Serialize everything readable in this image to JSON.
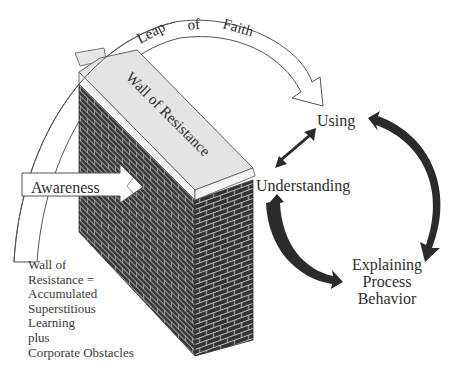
{
  "diagram": {
    "leap_arrow": {
      "words": [
        "Leap",
        "of",
        "Faith"
      ]
    },
    "wall": {
      "label": "Wall of Resistance",
      "colors": {
        "brick": "#3a3a3a",
        "mortar": "#cfcfcf",
        "cap": "#e6e6e6",
        "outline": "#444444"
      }
    },
    "awareness_arrow": {
      "label": "Awareness"
    },
    "cycle": {
      "nodes": [
        {
          "id": "using",
          "label": "Using"
        },
        {
          "id": "understanding",
          "label": "Understanding"
        },
        {
          "id": "explaining",
          "lines": [
            "Explaining",
            "Process",
            "Behavior"
          ]
        }
      ],
      "arrow_color": "#2b2b2b"
    },
    "note": {
      "lines": [
        "Wall of",
        "Resistance =",
        "Accumulated",
        "Superstitious",
        "Learning",
        "plus",
        "Corporate Obstacles"
      ]
    }
  }
}
